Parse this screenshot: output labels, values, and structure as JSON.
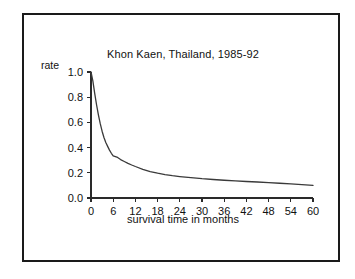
{
  "figure": {
    "background_color": "#ffffff",
    "frame_color": "#1a1a1a"
  },
  "chart_data": {
    "type": "line",
    "title": "Khon Kaen, Thailand, 1985-92",
    "xlabel": "survival time in months",
    "ylabel": "rate",
    "xlim": [
      0,
      60
    ],
    "ylim": [
      0.0,
      1.0
    ],
    "grid": false,
    "legend": "none",
    "line_color": "#3a3a3a",
    "xticks": [
      0,
      6,
      12,
      18,
      24,
      30,
      36,
      42,
      48,
      54,
      60
    ],
    "xtick_labels": [
      "0",
      "6",
      "12",
      "18",
      "24",
      "30",
      "36",
      "42",
      "48",
      "54",
      "60"
    ],
    "yticks": [
      0.0,
      0.2,
      0.4,
      0.6,
      0.8,
      1.0
    ],
    "ytick_labels": [
      "0.0",
      "0.2",
      "0.4",
      "0.6",
      "0.8",
      "1.0"
    ],
    "series": [
      {
        "name": "survival rate",
        "x": [
          0,
          0.5,
          1,
          1.5,
          2,
          2.5,
          3,
          3.5,
          4,
          4.5,
          5,
          5.5,
          6,
          7,
          8,
          9,
          10,
          11,
          12,
          14,
          16,
          18,
          20,
          22,
          24,
          27,
          30,
          33,
          36,
          39,
          42,
          45,
          48,
          51,
          54,
          57,
          60
        ],
        "y": [
          1.0,
          0.93,
          0.83,
          0.74,
          0.66,
          0.59,
          0.53,
          0.48,
          0.44,
          0.41,
          0.38,
          0.355,
          0.335,
          0.325,
          0.305,
          0.29,
          0.275,
          0.262,
          0.25,
          0.228,
          0.21,
          0.197,
          0.186,
          0.177,
          0.17,
          0.161,
          0.153,
          0.147,
          0.141,
          0.136,
          0.131,
          0.127,
          0.122,
          0.117,
          0.112,
          0.106,
          0.1
        ]
      }
    ]
  }
}
